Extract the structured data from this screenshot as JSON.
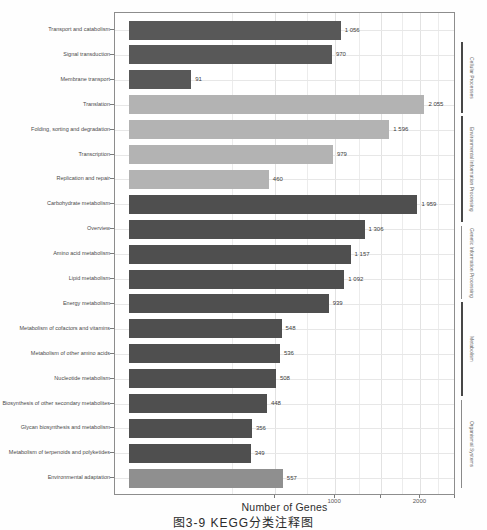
{
  "figure": {
    "caption": "图3-9  KEGG分类注释图"
  },
  "chart_data": {
    "type": "bar",
    "orientation": "horizontal",
    "title": "",
    "xlabel": "Number of Genes",
    "x_scale": "sqrt",
    "xlim": [
      0,
      2500
    ],
    "grid": true,
    "x_ticks": [
      {
        "value": 1000,
        "label": "1000"
      },
      {
        "value": 2000,
        "label": "2000"
      }
    ],
    "minor_tick_step": 250,
    "bars": [
      {
        "label": "Transport and catabolism",
        "value": 1056,
        "display": "1 056",
        "color": "#585858"
      },
      {
        "label": "Signal transduction",
        "value": 970,
        "display": "970",
        "color": "#585858"
      },
      {
        "label": "Membrane transport",
        "value": 91,
        "display": "91",
        "color": "#585858"
      },
      {
        "label": "Translation",
        "value": 2055,
        "display": "2 055",
        "color": "#b3b3b3"
      },
      {
        "label": "Folding, sorting and degradation",
        "value": 1596,
        "display": "1 596",
        "color": "#b3b3b3"
      },
      {
        "label": "Transcription",
        "value": 979,
        "display": "979",
        "color": "#b3b3b3"
      },
      {
        "label": "Replication and repair",
        "value": 460,
        "display": "460",
        "color": "#b3b3b3"
      },
      {
        "label": "Carbohydrate metabolism",
        "value": 1959,
        "display": "1 959",
        "color": "#4f4f4f"
      },
      {
        "label": "Overview",
        "value": 1306,
        "display": "1 306",
        "color": "#4f4f4f"
      },
      {
        "label": "Amino acid metabolism",
        "value": 1157,
        "display": "1 157",
        "color": "#4f4f4f"
      },
      {
        "label": "Lipid metabolism",
        "value": 1092,
        "display": "1 092",
        "color": "#4f4f4f"
      },
      {
        "label": "Energy metabolism",
        "value": 939,
        "display": "939",
        "color": "#4f4f4f"
      },
      {
        "label": "Metabolism of cofactors and vitamins",
        "value": 548,
        "display": "548",
        "color": "#4f4f4f"
      },
      {
        "label": "Metabolism of other amino acids",
        "value": 536,
        "display": "536",
        "color": "#4f4f4f"
      },
      {
        "label": "Nucleotide metabolism",
        "value": 508,
        "display": "508",
        "color": "#4f4f4f"
      },
      {
        "label": "Biosynthesis of other secondary metabolites",
        "value": 448,
        "display": "448",
        "color": "#4f4f4f"
      },
      {
        "label": "Glycan biosynthesis and metabolism",
        "value": 356,
        "display": "356",
        "color": "#4f4f4f"
      },
      {
        "label": "Metabolism of terpenoids and polyketides",
        "value": 349,
        "display": "349",
        "color": "#4f4f4f"
      },
      {
        "label": "Environmental adaptation",
        "value": 557,
        "display": "557",
        "color": "#8f8f8f"
      }
    ],
    "groups": [
      {
        "label": "Cellular Processes",
        "y_from": 42,
        "y_to": 113,
        "emphasis": "strong"
      },
      {
        "label": "Environmental Information Processing",
        "y_from": 116,
        "y_to": 222,
        "emphasis": "strong"
      },
      {
        "label": "Genetic Information Processing",
        "y_from": 226,
        "y_to": 299,
        "emphasis": "weak"
      },
      {
        "label": "Metabolism",
        "y_from": 302,
        "y_to": 396,
        "emphasis": "strong"
      },
      {
        "label": "Organismal Systems",
        "y_from": 400,
        "y_to": 488,
        "emphasis": "weak"
      }
    ]
  }
}
